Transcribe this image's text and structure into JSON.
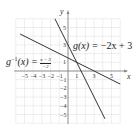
{
  "chart_data": {
    "type": "line",
    "title": "",
    "xlabel": "x",
    "ylabel": "y",
    "xlim": [
      -5.5,
      6
    ],
    "ylim": [
      -5.5,
      6
    ],
    "grid": true,
    "x_ticks": [
      -5,
      -4,
      -3,
      -2,
      -1,
      1,
      3,
      5
    ],
    "y_ticks": [
      -5,
      -4,
      -3,
      -2,
      -1,
      1,
      3,
      5
    ],
    "series": [
      {
        "name": "g(x) = −2x + 3",
        "label_parts": {
          "lhs": "g(x) = ",
          "rhs": "−2x + 3"
        },
        "slope": -2,
        "intercept": 3,
        "points": [
          [
            -1.5,
            6
          ],
          [
            4.25,
            -5.5
          ]
        ]
      },
      {
        "name": "g⁻¹(x) = (x − 3)/−2",
        "label_parts": {
          "lhs": "g",
          "sup": "−1",
          "mid": "(x) = ",
          "num": "x − 3",
          "den": "−2"
        },
        "slope": -0.5,
        "intercept": 1.5,
        "points": [
          [
            -5.5,
            4.25
          ],
          [
            6,
            -1.5
          ]
        ]
      }
    ],
    "annotations": [
      "g(x) = −2x + 3",
      "g⁻¹(x) = (x − 3)/−2"
    ]
  },
  "axes": {
    "x_label": "x",
    "y_label": "y"
  },
  "colors": {
    "line": "#333333",
    "grid": "#d9d9d9",
    "axis": "#888888"
  }
}
